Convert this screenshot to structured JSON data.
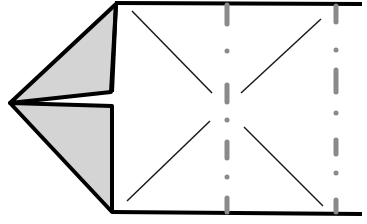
{
  "diagram": {
    "colors": {
      "outline": "#000000",
      "flap_fill": "#d4d4d4",
      "crease": "#1a1a1a",
      "mountain_fold": "#8a8a8a",
      "paper": "#ffffff"
    },
    "elements": [
      {
        "name": "upper-flap",
        "type": "folded flap"
      },
      {
        "name": "lower-flap",
        "type": "folded flap"
      },
      {
        "name": "crease-x",
        "type": "valley creases"
      },
      {
        "name": "mountain-fold-1",
        "type": "mountain fold line"
      },
      {
        "name": "mountain-fold-2",
        "type": "mountain fold line"
      }
    ]
  }
}
